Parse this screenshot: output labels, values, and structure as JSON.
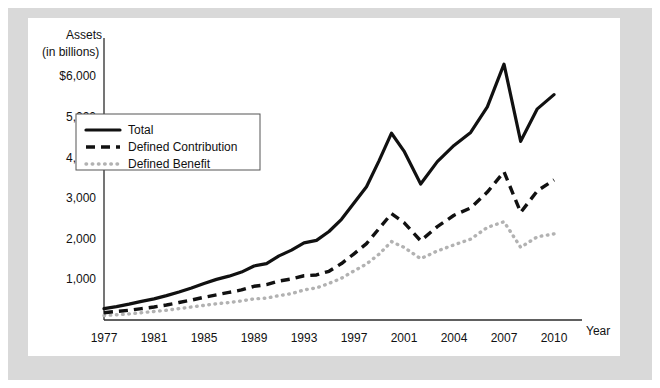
{
  "figure": {
    "panel_background": "#ffffff",
    "mount_background": "#d9d9d9"
  },
  "chart_data": {
    "type": "line",
    "title": "",
    "subtitle": "",
    "ylabel_line1": "Assets",
    "ylabel_line2": "(in billions)",
    "xlabel": "Year",
    "grid": false,
    "legend_position": "upper-left-inside",
    "ylim": [
      0,
      6600
    ],
    "xlim": [
      1977,
      2010
    ],
    "ytick_labels": [
      "$6,000",
      "5,000",
      "4,000",
      "3,000",
      "2,000",
      "1,000"
    ],
    "ytick_values": [
      6000,
      5000,
      4000,
      3000,
      2000,
      1000
    ],
    "xtick_labels": [
      "1977",
      "1981",
      "1985",
      "1989",
      "1993",
      "1997",
      "2001",
      "2004",
      "2007",
      "2010"
    ],
    "xtick_values": [
      1977,
      1981,
      1985,
      1989,
      1993,
      1997,
      2001,
      2004,
      2007,
      2010
    ],
    "x": [
      1977,
      1978,
      1979,
      1980,
      1981,
      1982,
      1983,
      1984,
      1985,
      1986,
      1987,
      1988,
      1989,
      1990,
      1991,
      1992,
      1993,
      1994,
      1995,
      1996,
      1997,
      1998,
      1999,
      2000,
      2001,
      2002,
      2003,
      2004,
      2005,
      2006,
      2007,
      2008,
      2009,
      2010
    ],
    "series": [
      {
        "name": "Total",
        "color": "#111111",
        "style": "solid",
        "values": [
          280,
          330,
          390,
          460,
          520,
          600,
          690,
          790,
          900,
          1000,
          1080,
          1180,
          1330,
          1390,
          1580,
          1720,
          1900,
          1960,
          2180,
          2480,
          2880,
          3280,
          3920,
          4600,
          4160,
          3350,
          3900,
          4300,
          4620,
          5250,
          6300,
          4400,
          5200,
          5550
        ]
      },
      {
        "name": "Defined Contribution",
        "color": "#111111",
        "style": "dashed",
        "values": [
          180,
          210,
          240,
          280,
          320,
          370,
          430,
          490,
          560,
          620,
          680,
          740,
          830,
          870,
          960,
          1010,
          1090,
          1110,
          1200,
          1390,
          1630,
          1880,
          2250,
          2620,
          2400,
          1950,
          2300,
          2580,
          2760,
          3150,
          3650,
          2650,
          3180,
          3450
        ]
      },
      {
        "name": "Defined Benefit",
        "color": "#b2b2b2",
        "style": "dotted",
        "values": [
          110,
          130,
          150,
          180,
          210,
          240,
          280,
          320,
          360,
          400,
          430,
          470,
          520,
          540,
          600,
          650,
          740,
          790,
          900,
          1030,
          1210,
          1380,
          1620,
          1930,
          1790,
          1510,
          1700,
          1850,
          1990,
          2280,
          2420,
          1790,
          2050,
          2120
        ]
      }
    ],
    "legend": [
      {
        "label": "Total",
        "style": "solid",
        "color": "#111111"
      },
      {
        "label": "Defined Contribution",
        "style": "dashed",
        "color": "#111111"
      },
      {
        "label": "Defined Benefit",
        "style": "dotted",
        "color": "#b2b2b2"
      }
    ]
  }
}
